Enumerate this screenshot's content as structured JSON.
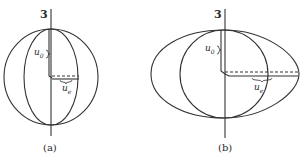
{
  "figure": {
    "panels": [
      {
        "id": "a",
        "caption": "(a)",
        "axis_label": "3",
        "u0": {
          "base": "u",
          "sub": "0"
        },
        "ue": {
          "base": "u",
          "sub": "e"
        },
        "description": "Sphere with inner meridian ellipse; u0 polar radius equals ue equatorial radius"
      },
      {
        "id": "b",
        "caption": "(b)",
        "axis_label": "3",
        "u0": {
          "base": "u",
          "sub": "0"
        },
        "ue": {
          "base": "u",
          "sub": "e"
        },
        "description": "Oblate spheroid around sphere; equatorial radius ue larger than polar radius u0"
      }
    ],
    "colors": {
      "stroke": "#333333",
      "background": "#ffffff"
    }
  }
}
